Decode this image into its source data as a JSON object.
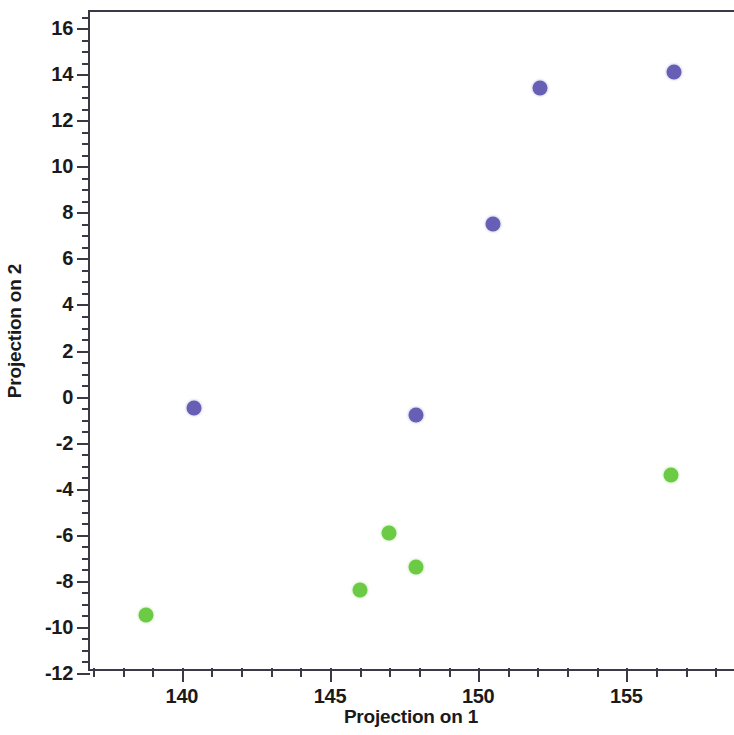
{
  "chart_data": {
    "type": "scatter",
    "title": "",
    "xlabel": "Projection on 1",
    "ylabel": "Projection on 2",
    "xlim": [
      136.9,
      158.7
    ],
    "ylim": [
      -12,
      16.7
    ],
    "xticks": [
      140,
      145,
      150,
      155
    ],
    "xtick_labels": [
      "140",
      "145",
      "150",
      "155"
    ],
    "x_minor_step": 1,
    "yticks": [
      -12,
      -10,
      -8,
      -6,
      -4,
      -2,
      0,
      2,
      4,
      6,
      8,
      10,
      12,
      14,
      16
    ],
    "ytick_labels": [
      "-12",
      "-10",
      "-8",
      "-6",
      "-4",
      "-2",
      "0",
      "2",
      "4",
      "6",
      "8",
      "10",
      "12",
      "14",
      "16"
    ],
    "y_minor_step": 0.5,
    "grid": false,
    "legend": "none",
    "marker": "circle",
    "series": [
      {
        "name": "Class 1",
        "color": "#665fb5",
        "points": [
          {
            "x": 140.4,
            "y": -0.5
          },
          {
            "x": 147.9,
            "y": -0.8
          },
          {
            "x": 150.5,
            "y": 7.5
          },
          {
            "x": 152.1,
            "y": 13.4
          },
          {
            "x": 156.6,
            "y": 14.1
          }
        ]
      },
      {
        "name": "Class 2",
        "color": "#6bcb45",
        "points": [
          {
            "x": 138.8,
            "y": -9.5
          },
          {
            "x": 146.0,
            "y": -8.4
          },
          {
            "x": 147.0,
            "y": -5.9
          },
          {
            "x": 147.9,
            "y": -7.4
          },
          {
            "x": 156.5,
            "y": -3.4
          }
        ]
      }
    ]
  }
}
